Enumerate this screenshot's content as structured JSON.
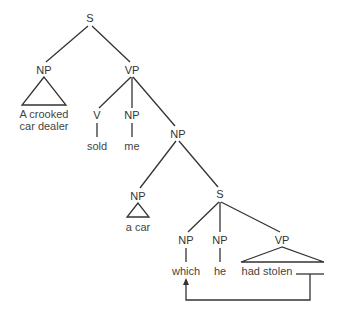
{
  "diagram": {
    "type": "syntax-tree",
    "line_color": "#333333",
    "nodes": {
      "root_s": "S",
      "subject_np": "NP",
      "subject_words_line1": "A crooked",
      "subject_words_line2": "car dealer",
      "vp": "VP",
      "verb": "V",
      "verb_word": "sold",
      "object1_np": "NP",
      "object1_word": "me",
      "object2_np": "NP",
      "det_np": "NP",
      "det_np_words": "a car",
      "rel_s": "S",
      "rel_np_which": "NP",
      "rel_word_which": "which",
      "rel_np_he": "NP",
      "rel_word_he": "he",
      "rel_vp": "VP",
      "rel_vp_words": "had stolen"
    },
    "annotations": {
      "gap": "trace gap after 'had stolen'",
      "arrow": "movement arrow from gap to 'which'"
    }
  }
}
